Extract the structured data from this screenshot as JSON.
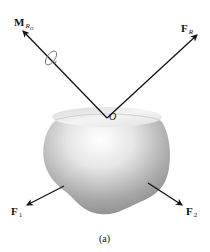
{
  "figure": {
    "caption": "(a)",
    "origin_label": "O",
    "vectors": {
      "moment": {
        "symbol": "M",
        "subscript": "R",
        "subsubscript": "O",
        "color": "#111111"
      },
      "resultant": {
        "symbol": "F",
        "subscript": "R",
        "color": "#111111"
      },
      "force1": {
        "symbol": "F",
        "subscript": "1",
        "color": "#111111"
      },
      "force2": {
        "symbol": "F",
        "subscript": "2",
        "color": "#111111"
      }
    },
    "body": {
      "shape": "rounded-pot",
      "shading_light": "#ffffff",
      "shading_dark": "#8a8a8a"
    }
  }
}
